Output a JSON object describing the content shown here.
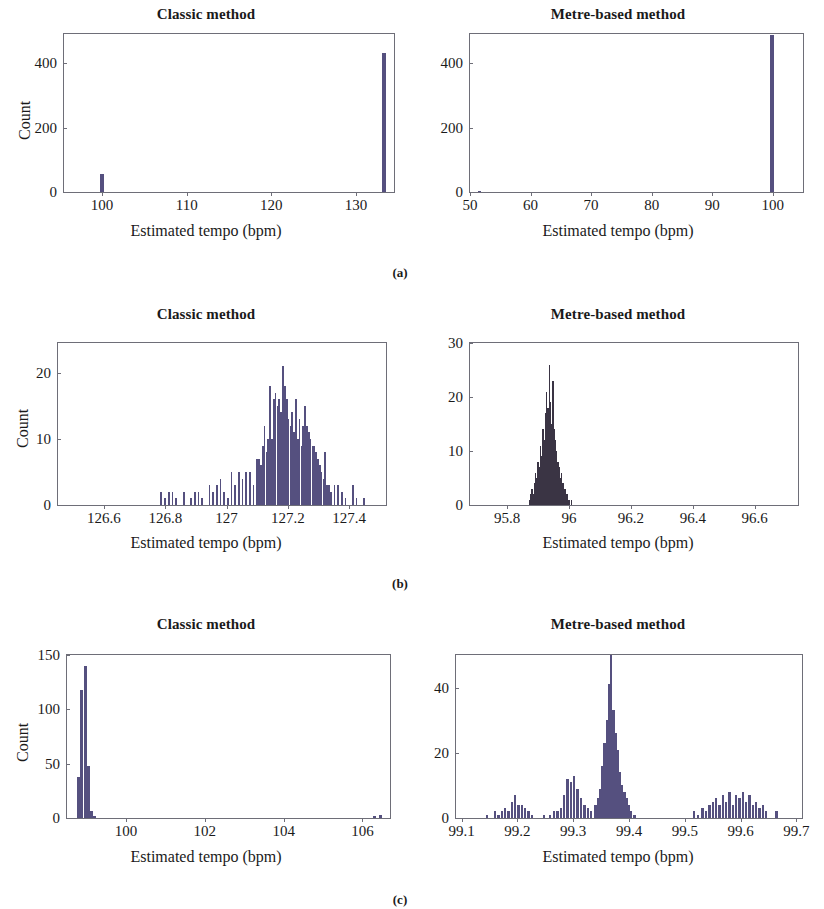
{
  "figure": {
    "caption_a": "(a)",
    "caption_b": "(b)",
    "caption_c": "(c)",
    "bar_color": "#55507f",
    "bar_color_dense": "#3a3444",
    "axis_color": "#6e6e78",
    "background": "#ffffff"
  },
  "chart_data": [
    {
      "id": "a-left",
      "type": "bar",
      "title": "Classic method",
      "xlabel": "Estimated tempo (bpm)",
      "ylabel": "Count",
      "xlim": [
        95.5,
        134.5
      ],
      "ylim": [
        0,
        490
      ],
      "xticks": [
        100,
        110,
        120,
        130
      ],
      "xticklabels": [
        "100",
        "110",
        "120",
        "130"
      ],
      "yticks": [
        0,
        200,
        400
      ],
      "yticklabels": [
        "0",
        "200",
        "400"
      ],
      "grid": false,
      "bin_width": 0.45,
      "bars": [
        {
          "x": 100.0,
          "y": 55
        },
        {
          "x": 133.35,
          "y": 432
        }
      ]
    },
    {
      "id": "a-right",
      "type": "bar",
      "title": "Metre-based method",
      "xlabel": "Estimated tempo (bpm)",
      "ylabel": "",
      "xlim": [
        50,
        105
      ],
      "ylim": [
        0,
        490
      ],
      "xticks": [
        50,
        60,
        70,
        80,
        90,
        100
      ],
      "xticklabels": [
        "50",
        "60",
        "70",
        "80",
        "90",
        "100"
      ],
      "yticks": [
        0,
        200,
        400
      ],
      "yticklabels": [
        "0",
        "200",
        "400"
      ],
      "grid": false,
      "bin_width": 0.55,
      "bars": [
        {
          "x": 51.6,
          "y": 4
        },
        {
          "x": 99.9,
          "y": 487
        }
      ]
    },
    {
      "id": "b-left",
      "type": "bar",
      "title": "Classic method",
      "xlabel": "Estimated tempo (bpm)",
      "ylabel": "Count",
      "xlim": [
        126.45,
        127.52
      ],
      "ylim": [
        0,
        24.5
      ],
      "xticks": [
        126.6,
        126.8,
        127.0,
        127.2,
        127.4
      ],
      "xticklabels": [
        "126.6",
        "126.8",
        "127",
        "127.2",
        "127.4"
      ],
      "yticks": [
        0,
        10,
        20
      ],
      "yticklabels": [
        "0",
        "10",
        "20"
      ],
      "grid": false,
      "bin_width": 0.0055,
      "bars": [
        {
          "x": 126.785,
          "y": 2
        },
        {
          "x": 126.8,
          "y": 1
        },
        {
          "x": 126.812,
          "y": 2
        },
        {
          "x": 126.824,
          "y": 2
        },
        {
          "x": 126.836,
          "y": 1
        },
        {
          "x": 126.86,
          "y": 2
        },
        {
          "x": 126.884,
          "y": 1
        },
        {
          "x": 126.896,
          "y": 2
        },
        {
          "x": 126.908,
          "y": 2
        },
        {
          "x": 126.92,
          "y": 1
        },
        {
          "x": 126.944,
          "y": 3
        },
        {
          "x": 126.956,
          "y": 2
        },
        {
          "x": 126.968,
          "y": 3
        },
        {
          "x": 126.98,
          "y": 4
        },
        {
          "x": 126.992,
          "y": 2
        },
        {
          "x": 127.004,
          "y": 1
        },
        {
          "x": 127.016,
          "y": 5
        },
        {
          "x": 127.028,
          "y": 3
        },
        {
          "x": 127.04,
          "y": 5
        },
        {
          "x": 127.052,
          "y": 4
        },
        {
          "x": 127.064,
          "y": 5
        },
        {
          "x": 127.076,
          "y": 5
        },
        {
          "x": 127.088,
          "y": 3
        },
        {
          "x": 127.1,
          "y": 7
        },
        {
          "x": 127.106,
          "y": 7
        },
        {
          "x": 127.112,
          "y": 6
        },
        {
          "x": 127.118,
          "y": 9
        },
        {
          "x": 127.124,
          "y": 12
        },
        {
          "x": 127.13,
          "y": 8
        },
        {
          "x": 127.136,
          "y": 10
        },
        {
          "x": 127.142,
          "y": 18
        },
        {
          "x": 127.148,
          "y": 10
        },
        {
          "x": 127.154,
          "y": 16
        },
        {
          "x": 127.16,
          "y": 17
        },
        {
          "x": 127.166,
          "y": 15
        },
        {
          "x": 127.172,
          "y": 16
        },
        {
          "x": 127.178,
          "y": 14
        },
        {
          "x": 127.184,
          "y": 21
        },
        {
          "x": 127.19,
          "y": 18
        },
        {
          "x": 127.196,
          "y": 16
        },
        {
          "x": 127.202,
          "y": 13
        },
        {
          "x": 127.208,
          "y": 12
        },
        {
          "x": 127.214,
          "y": 14
        },
        {
          "x": 127.22,
          "y": 11
        },
        {
          "x": 127.226,
          "y": 16
        },
        {
          "x": 127.232,
          "y": 10
        },
        {
          "x": 127.238,
          "y": 13
        },
        {
          "x": 127.244,
          "y": 9
        },
        {
          "x": 127.25,
          "y": 12
        },
        {
          "x": 127.256,
          "y": 15
        },
        {
          "x": 127.262,
          "y": 12
        },
        {
          "x": 127.268,
          "y": 11
        },
        {
          "x": 127.274,
          "y": 10
        },
        {
          "x": 127.28,
          "y": 9
        },
        {
          "x": 127.286,
          "y": 9
        },
        {
          "x": 127.292,
          "y": 8
        },
        {
          "x": 127.298,
          "y": 7
        },
        {
          "x": 127.304,
          "y": 6
        },
        {
          "x": 127.31,
          "y": 5
        },
        {
          "x": 127.316,
          "y": 4
        },
        {
          "x": 127.322,
          "y": 8
        },
        {
          "x": 127.328,
          "y": 3
        },
        {
          "x": 127.334,
          "y": 3
        },
        {
          "x": 127.34,
          "y": 2
        },
        {
          "x": 127.352,
          "y": 3
        },
        {
          "x": 127.364,
          "y": 3
        },
        {
          "x": 127.376,
          "y": 2
        },
        {
          "x": 127.388,
          "y": 1
        },
        {
          "x": 127.412,
          "y": 3
        },
        {
          "x": 127.424,
          "y": 1
        },
        {
          "x": 127.448,
          "y": 1
        }
      ]
    },
    {
      "id": "b-right",
      "type": "bar",
      "title": "Metre-based method",
      "xlabel": "Estimated tempo (bpm)",
      "ylabel": "",
      "xlim": [
        95.68,
        96.74
      ],
      "ylim": [
        0,
        30
      ],
      "xticks": [
        95.8,
        96.0,
        96.2,
        96.4,
        96.6
      ],
      "xticklabels": [
        "95.8",
        "96",
        "96.2",
        "96.4",
        "96.6"
      ],
      "yticks": [
        0,
        10,
        20,
        30
      ],
      "yticklabels": [
        "0",
        "10",
        "20",
        "30"
      ],
      "grid": false,
      "bin_width": 0.0035,
      "bars": [
        {
          "x": 95.872,
          "y": 1
        },
        {
          "x": 95.876,
          "y": 2
        },
        {
          "x": 95.88,
          "y": 3
        },
        {
          "x": 95.884,
          "y": 2
        },
        {
          "x": 95.888,
          "y": 4
        },
        {
          "x": 95.892,
          "y": 6
        },
        {
          "x": 95.896,
          "y": 5
        },
        {
          "x": 95.9,
          "y": 8
        },
        {
          "x": 95.904,
          "y": 7
        },
        {
          "x": 95.908,
          "y": 11
        },
        {
          "x": 95.912,
          "y": 9
        },
        {
          "x": 95.916,
          "y": 14
        },
        {
          "x": 95.92,
          "y": 12
        },
        {
          "x": 95.924,
          "y": 17
        },
        {
          "x": 95.928,
          "y": 21
        },
        {
          "x": 95.932,
          "y": 18
        },
        {
          "x": 95.936,
          "y": 26
        },
        {
          "x": 95.94,
          "y": 19
        },
        {
          "x": 95.944,
          "y": 15
        },
        {
          "x": 95.948,
          "y": 23
        },
        {
          "x": 95.952,
          "y": 14
        },
        {
          "x": 95.956,
          "y": 12
        },
        {
          "x": 95.96,
          "y": 10
        },
        {
          "x": 95.964,
          "y": 8
        },
        {
          "x": 95.968,
          "y": 7
        },
        {
          "x": 95.972,
          "y": 5
        },
        {
          "x": 95.976,
          "y": 6
        },
        {
          "x": 95.98,
          "y": 4
        },
        {
          "x": 95.984,
          "y": 3
        },
        {
          "x": 95.988,
          "y": 3
        },
        {
          "x": 95.992,
          "y": 2
        },
        {
          "x": 95.996,
          "y": 2
        },
        {
          "x": 96.0,
          "y": 1
        },
        {
          "x": 96.008,
          "y": 1
        }
      ]
    },
    {
      "id": "c-left",
      "type": "bar",
      "title": "Classic method",
      "xlabel": "Estimated tempo (bpm)",
      "ylabel": "Count",
      "xlim": [
        98.5,
        106.7
      ],
      "ylim": [
        0,
        150
      ],
      "xticks": [
        100,
        102,
        104,
        106
      ],
      "xticklabels": [
        "100",
        "102",
        "104",
        "106"
      ],
      "yticks": [
        0,
        50,
        100,
        150
      ],
      "yticklabels": [
        "0",
        "50",
        "100",
        "150"
      ],
      "grid": false,
      "bin_width": 0.075,
      "bars": [
        {
          "x": 98.8,
          "y": 38
        },
        {
          "x": 98.88,
          "y": 118
        },
        {
          "x": 98.96,
          "y": 140
        },
        {
          "x": 99.04,
          "y": 48
        },
        {
          "x": 99.12,
          "y": 6
        },
        {
          "x": 99.2,
          "y": 2
        },
        {
          "x": 106.3,
          "y": 2
        },
        {
          "x": 106.45,
          "y": 3
        }
      ]
    },
    {
      "id": "c-right",
      "type": "bar",
      "title": "Metre-based method",
      "xlabel": "Estimated tempo (bpm)",
      "ylabel": "",
      "xlim": [
        99.09,
        99.71
      ],
      "ylim": [
        0,
        50
      ],
      "xticks": [
        99.1,
        99.2,
        99.3,
        99.4,
        99.5,
        99.6,
        99.7
      ],
      "xticklabels": [
        "99.1",
        "99.2",
        "99.3",
        "99.4",
        "99.5",
        "99.6",
        "99.7"
      ],
      "yticks": [
        0,
        20,
        40
      ],
      "yticklabels": [
        "0",
        "20",
        "40"
      ],
      "grid": false,
      "bin_width": 0.0042,
      "bars": [
        {
          "x": 99.145,
          "y": 1
        },
        {
          "x": 99.16,
          "y": 2
        },
        {
          "x": 99.166,
          "y": 1
        },
        {
          "x": 99.172,
          "y": 2
        },
        {
          "x": 99.178,
          "y": 3
        },
        {
          "x": 99.184,
          "y": 2
        },
        {
          "x": 99.19,
          "y": 5
        },
        {
          "x": 99.196,
          "y": 7
        },
        {
          "x": 99.202,
          "y": 4
        },
        {
          "x": 99.208,
          "y": 4
        },
        {
          "x": 99.214,
          "y": 3
        },
        {
          "x": 99.22,
          "y": 2
        },
        {
          "x": 99.226,
          "y": 1
        },
        {
          "x": 99.248,
          "y": 1
        },
        {
          "x": 99.258,
          "y": 1
        },
        {
          "x": 99.266,
          "y": 2
        },
        {
          "x": 99.272,
          "y": 2
        },
        {
          "x": 99.278,
          "y": 3
        },
        {
          "x": 99.284,
          "y": 7
        },
        {
          "x": 99.29,
          "y": 12
        },
        {
          "x": 99.296,
          "y": 11
        },
        {
          "x": 99.302,
          "y": 13
        },
        {
          "x": 99.308,
          "y": 9
        },
        {
          "x": 99.314,
          "y": 6
        },
        {
          "x": 99.32,
          "y": 4
        },
        {
          "x": 99.326,
          "y": 3
        },
        {
          "x": 99.332,
          "y": 2
        },
        {
          "x": 99.34,
          "y": 4
        },
        {
          "x": 99.344,
          "y": 6
        },
        {
          "x": 99.348,
          "y": 9
        },
        {
          "x": 99.352,
          "y": 16
        },
        {
          "x": 99.356,
          "y": 23
        },
        {
          "x": 99.36,
          "y": 30
        },
        {
          "x": 99.364,
          "y": 41
        },
        {
          "x": 99.368,
          "y": 50
        },
        {
          "x": 99.372,
          "y": 33
        },
        {
          "x": 99.376,
          "y": 26
        },
        {
          "x": 99.38,
          "y": 21
        },
        {
          "x": 99.384,
          "y": 14
        },
        {
          "x": 99.388,
          "y": 10
        },
        {
          "x": 99.392,
          "y": 8
        },
        {
          "x": 99.396,
          "y": 6
        },
        {
          "x": 99.4,
          "y": 4
        },
        {
          "x": 99.404,
          "y": 2
        },
        {
          "x": 99.41,
          "y": 1
        },
        {
          "x": 99.516,
          "y": 2
        },
        {
          "x": 99.524,
          "y": 1
        },
        {
          "x": 99.532,
          "y": 3
        },
        {
          "x": 99.538,
          "y": 2
        },
        {
          "x": 99.544,
          "y": 4
        },
        {
          "x": 99.55,
          "y": 5
        },
        {
          "x": 99.556,
          "y": 6
        },
        {
          "x": 99.562,
          "y": 4
        },
        {
          "x": 99.568,
          "y": 7
        },
        {
          "x": 99.574,
          "y": 5
        },
        {
          "x": 99.58,
          "y": 8
        },
        {
          "x": 99.586,
          "y": 4
        },
        {
          "x": 99.592,
          "y": 7
        },
        {
          "x": 99.598,
          "y": 6
        },
        {
          "x": 99.604,
          "y": 8
        },
        {
          "x": 99.61,
          "y": 5
        },
        {
          "x": 99.616,
          "y": 7
        },
        {
          "x": 99.622,
          "y": 4
        },
        {
          "x": 99.628,
          "y": 5
        },
        {
          "x": 99.634,
          "y": 3
        },
        {
          "x": 99.64,
          "y": 4
        },
        {
          "x": 99.646,
          "y": 2
        },
        {
          "x": 99.664,
          "y": 2
        }
      ]
    }
  ]
}
